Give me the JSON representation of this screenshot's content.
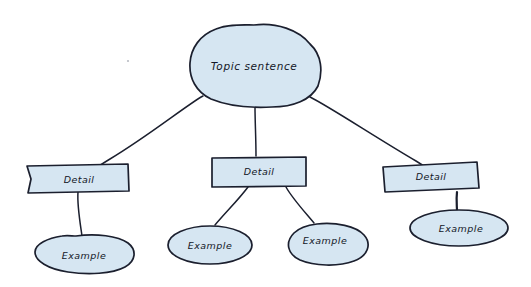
{
  "diagram": {
    "style": "hand-drawn",
    "colors": {
      "background": "#ffffff",
      "node_fill": "#d6e6f2",
      "stroke": "#1b1f2e",
      "text": "#131726"
    },
    "root": {
      "id": "topic-sentence",
      "label": "Topic sentence",
      "shape": "cloud"
    },
    "branches": [
      {
        "id": "detail-left",
        "label": "Detail",
        "shape": "rectangle",
        "examples": [
          {
            "id": "example-left-1",
            "label": "Example",
            "shape": "ellipse"
          }
        ]
      },
      {
        "id": "detail-middle",
        "label": "Detail",
        "shape": "rectangle",
        "examples": [
          {
            "id": "example-middle-1",
            "label": "Example",
            "shape": "ellipse"
          },
          {
            "id": "example-middle-2",
            "label": "Example",
            "shape": "ellipse"
          }
        ]
      },
      {
        "id": "detail-right",
        "label": "Detail",
        "shape": "rectangle",
        "examples": [
          {
            "id": "example-right-1",
            "label": "Example",
            "shape": "ellipse"
          }
        ]
      }
    ]
  }
}
